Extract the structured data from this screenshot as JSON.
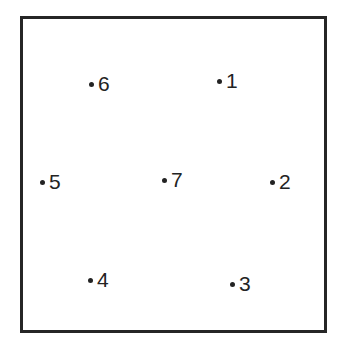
{
  "figure": {
    "title": "",
    "background_color": "#ffffff",
    "width": 340,
    "height": 339
  },
  "frame": {
    "name": "plot-border",
    "x": 20,
    "y": 16,
    "width": 307,
    "height": 317,
    "border_width": 3,
    "border_color": "#262626",
    "fill_color": "#ffffff"
  },
  "style": {
    "dot_color": "#232323",
    "dot_diameter": 5,
    "label_color": "#232323",
    "label_font_size": 21,
    "label_offset_x": 7,
    "label_offset_y": -11
  },
  "chart_data": {
    "type": "scatter",
    "title": "",
    "xlabel": "",
    "ylabel": "",
    "xlim": [
      20,
      327
    ],
    "ylim": [
      16,
      333
    ],
    "grid": false,
    "legend": "none",
    "axis_ticks": false,
    "labels": [
      "1",
      "2",
      "3",
      "4",
      "5",
      "6",
      "7"
    ],
    "points": [
      {
        "label": "1",
        "x": 219,
        "y": 81
      },
      {
        "label": "2",
        "x": 272,
        "y": 182
      },
      {
        "label": "3",
        "x": 232,
        "y": 284
      },
      {
        "label": "4",
        "x": 90,
        "y": 280
      },
      {
        "label": "5",
        "x": 42,
        "y": 182
      },
      {
        "label": "6",
        "x": 91,
        "y": 84
      },
      {
        "label": "7",
        "x": 164,
        "y": 180
      }
    ]
  }
}
